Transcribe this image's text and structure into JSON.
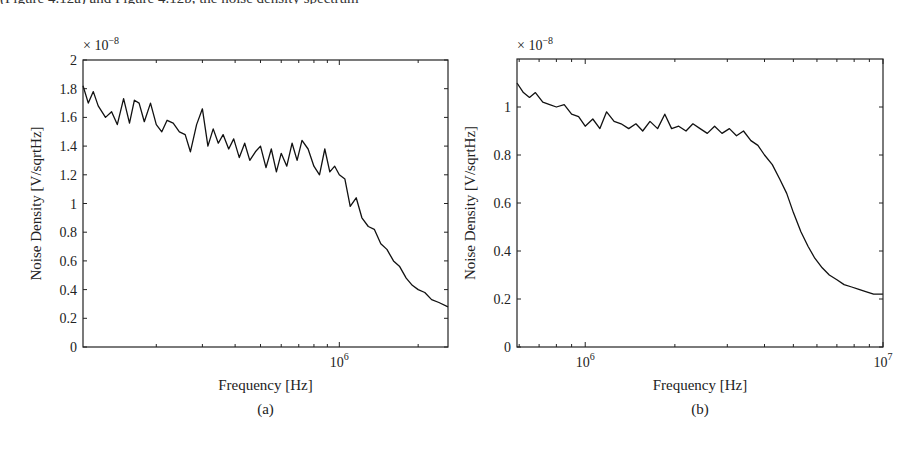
{
  "page": {
    "top_fragment_text": "(Figure 4.12a) and Figure 4.12b, the noise density spectrum"
  },
  "chart_data": [
    {
      "id": "a",
      "type": "line",
      "panel_label": "(a)",
      "title": "",
      "xlabel": "Frequency [Hz]",
      "ylabel": "Noise Density [V/sqrtHz]",
      "y_multiplier": "× 10",
      "y_multiplier_exp": "−8",
      "xscale": "log",
      "xlim": [
        105000,
        2600000
      ],
      "ylim": [
        0,
        2
      ],
      "x_major_ticks": [
        {
          "value": 1000000,
          "label": "10",
          "exp": "6"
        }
      ],
      "x_minor_ticks": [
        200000,
        300000,
        400000,
        500000,
        600000,
        700000,
        800000,
        900000,
        2000000
      ],
      "y_ticks": [
        {
          "value": 0,
          "label": "0"
        },
        {
          "value": 0.2,
          "label": "0.2"
        },
        {
          "value": 0.4,
          "label": "0.4"
        },
        {
          "value": 0.6,
          "label": "0.6"
        },
        {
          "value": 0.8,
          "label": "0.8"
        },
        {
          "value": 1,
          "label": "1"
        },
        {
          "value": 1.2,
          "label": "1.2"
        },
        {
          "value": 1.4,
          "label": "1.4"
        },
        {
          "value": 1.6,
          "label": "1.6"
        },
        {
          "value": 1.8,
          "label": "1.8"
        },
        {
          "value": 2,
          "label": "2"
        }
      ],
      "grid": false,
      "series": [
        {
          "name": "noise density",
          "x": [
            105000,
            110000,
            115000,
            120000,
            128000,
            135000,
            142000,
            150000,
            158000,
            165000,
            172000,
            180000,
            190000,
            200000,
            210000,
            220000,
            232000,
            245000,
            258000,
            270000,
            285000,
            300000,
            315000,
            330000,
            345000,
            360000,
            378000,
            395000,
            415000,
            435000,
            455000,
            478000,
            500000,
            525000,
            550000,
            575000,
            600000,
            630000,
            660000,
            690000,
            720000,
            760000,
            800000,
            840000,
            880000,
            920000,
            960000,
            1000000,
            1050000,
            1100000,
            1160000,
            1220000,
            1290000,
            1360000,
            1440000,
            1520000,
            1610000,
            1700000,
            1800000,
            1900000,
            2000000,
            2120000,
            2250000,
            2400000,
            2600000
          ],
          "values": [
            1.82,
            1.7,
            1.78,
            1.68,
            1.6,
            1.64,
            1.55,
            1.73,
            1.56,
            1.72,
            1.7,
            1.57,
            1.7,
            1.55,
            1.5,
            1.58,
            1.56,
            1.5,
            1.48,
            1.36,
            1.55,
            1.66,
            1.4,
            1.52,
            1.42,
            1.48,
            1.38,
            1.45,
            1.32,
            1.42,
            1.3,
            1.36,
            1.4,
            1.25,
            1.38,
            1.22,
            1.35,
            1.26,
            1.42,
            1.3,
            1.44,
            1.38,
            1.26,
            1.2,
            1.38,
            1.22,
            1.26,
            1.2,
            1.17,
            0.98,
            1.04,
            0.9,
            0.84,
            0.82,
            0.72,
            0.68,
            0.6,
            0.56,
            0.48,
            0.43,
            0.4,
            0.38,
            0.33,
            0.31,
            0.28
          ]
        }
      ]
    },
    {
      "id": "b",
      "type": "line",
      "panel_label": "(b)",
      "title": "",
      "xlabel": "Frequency [Hz]",
      "ylabel": "Noise Density [V/sqrtHz]",
      "y_multiplier": "× 10",
      "y_multiplier_exp": "−8",
      "xscale": "log",
      "xlim": [
        590000,
        10000000
      ],
      "ylim": [
        0,
        1.2
      ],
      "x_major_ticks": [
        {
          "value": 1000000,
          "label": "10",
          "exp": "6"
        },
        {
          "value": 10000000,
          "label": "10",
          "exp": "7"
        }
      ],
      "x_minor_ticks": [
        600000,
        700000,
        800000,
        900000,
        2000000,
        3000000,
        4000000,
        5000000,
        6000000,
        7000000,
        8000000,
        9000000
      ],
      "y_ticks": [
        {
          "value": 0,
          "label": "0"
        },
        {
          "value": 0.2,
          "label": "0.2"
        },
        {
          "value": 0.4,
          "label": "0.4"
        },
        {
          "value": 0.6,
          "label": "0.6"
        },
        {
          "value": 0.8,
          "label": "0.8"
        },
        {
          "value": 1,
          "label": "1"
        }
      ],
      "grid": false,
      "series": [
        {
          "name": "noise density",
          "x": [
            590000,
            620000,
            650000,
            680000,
            720000,
            760000,
            800000,
            850000,
            900000,
            950000,
            1000000,
            1060000,
            1120000,
            1180000,
            1250000,
            1320000,
            1400000,
            1480000,
            1560000,
            1650000,
            1750000,
            1850000,
            1950000,
            2060000,
            2180000,
            2300000,
            2430000,
            2570000,
            2720000,
            2880000,
            3050000,
            3220000,
            3400000,
            3600000,
            3800000,
            4000000,
            4250000,
            4500000,
            4750000,
            5000000,
            5300000,
            5600000,
            5900000,
            6250000,
            6600000,
            7000000,
            7400000,
            7850000,
            8300000,
            8800000,
            9300000,
            10000000
          ],
          "values": [
            1.1,
            1.06,
            1.04,
            1.06,
            1.02,
            1.01,
            1.0,
            1.01,
            0.97,
            0.96,
            0.92,
            0.95,
            0.91,
            0.98,
            0.94,
            0.93,
            0.91,
            0.93,
            0.9,
            0.94,
            0.91,
            0.97,
            0.91,
            0.92,
            0.9,
            0.93,
            0.91,
            0.89,
            0.92,
            0.89,
            0.91,
            0.88,
            0.9,
            0.86,
            0.84,
            0.8,
            0.76,
            0.7,
            0.64,
            0.56,
            0.48,
            0.42,
            0.37,
            0.33,
            0.3,
            0.28,
            0.26,
            0.25,
            0.24,
            0.23,
            0.22,
            0.22
          ]
        }
      ]
    }
  ]
}
